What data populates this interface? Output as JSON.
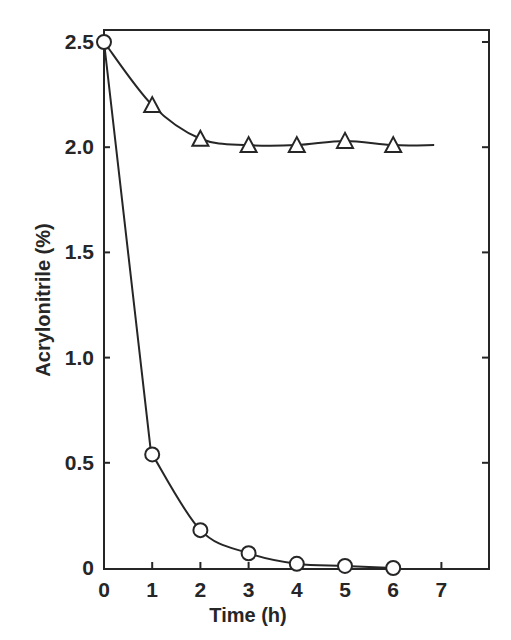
{
  "chart_data": {
    "type": "line",
    "title": "",
    "xlabel": "Time (h)",
    "ylabel": "Acrylonitrile (%)",
    "xlim": [
      0,
      8
    ],
    "ylim": [
      0,
      2.6
    ],
    "x_ticks": [
      0,
      1,
      2,
      3,
      4,
      5,
      6,
      7
    ],
    "x_tick_labels": [
      "0",
      "1",
      "2",
      "3",
      "4",
      "5",
      "6",
      "7"
    ],
    "y_ticks": [
      0,
      0.5,
      1.0,
      1.5,
      2.0,
      2.5
    ],
    "y_tick_labels": [
      "0",
      "0.5",
      "1.0",
      "1.5",
      "2.0",
      "2.5"
    ],
    "grid": false,
    "legend": null,
    "x": [
      0,
      1,
      2,
      3,
      4,
      5,
      6
    ],
    "series": [
      {
        "name": "circles",
        "marker": "circle-open",
        "x": [
          0,
          1,
          2,
          3,
          4,
          5,
          6
        ],
        "values": [
          2.5,
          0.54,
          0.18,
          0.07,
          0.02,
          0.01,
          0.0
        ]
      },
      {
        "name": "triangles",
        "marker": "triangle-open",
        "x": [
          0,
          1,
          2,
          3,
          4,
          5,
          6
        ],
        "values": [
          2.5,
          2.2,
          2.04,
          2.01,
          2.01,
          2.03,
          2.01
        ],
        "line_extends_to_x": 6.85
      }
    ]
  },
  "colors": {
    "ink": "#262626",
    "background": "#ffffff"
  }
}
